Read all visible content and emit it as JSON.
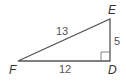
{
  "diagram": {
    "type": "right-triangle",
    "vertices": {
      "E": {
        "label": "E",
        "x": 110,
        "y": 19
      },
      "F": {
        "label": "F",
        "x": 18,
        "y": 61
      },
      "D": {
        "label": "D",
        "x": 110,
        "y": 61
      }
    },
    "sides": {
      "FE": {
        "label": "13"
      },
      "FD": {
        "label": "12"
      },
      "DE": {
        "label": "5"
      }
    },
    "right_angle_at": "D",
    "colors": {
      "stroke": "#555555",
      "text": "#333333",
      "background": "#ffffff"
    }
  }
}
